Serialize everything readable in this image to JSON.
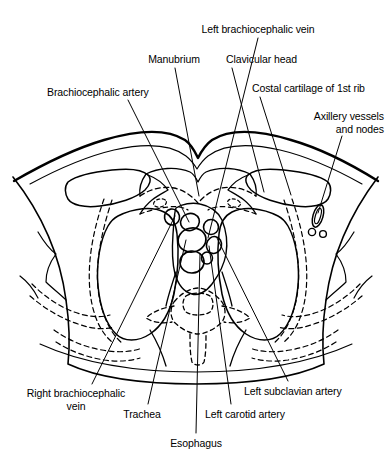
{
  "figure": {
    "type": "anatomical-line-diagram",
    "line_color": "#000000",
    "background_color": "#ffffff",
    "width": 391,
    "height": 475
  },
  "labels": [
    {
      "id": "left-brachiocephalic-vein",
      "text": "Left brachiocephalic vein",
      "align": "align-center",
      "x": 182,
      "y": 23,
      "w": 152
    },
    {
      "id": "manubrium",
      "text": "Manubrium",
      "align": "align-center",
      "x": 134,
      "y": 53,
      "w": 80
    },
    {
      "id": "clavicular-head",
      "text": "Clavicular head",
      "align": "align-left",
      "x": 226,
      "y": 53,
      "w": 100
    },
    {
      "id": "brachiocephalic-artery",
      "text": "Brachiocephalic artery",
      "align": "align-left",
      "x": 47,
      "y": 86,
      "w": 140
    },
    {
      "id": "costal-cartilage-of-1st-rib",
      "text": "Costal cartilage of 1st rib",
      "align": "align-left",
      "x": 252,
      "y": 82,
      "w": 144
    },
    {
      "id": "axillery-vessels-and-nodes",
      "text": "Axillery vessels\nand nodes",
      "align": "align-right",
      "x": 274,
      "y": 110,
      "w": 110
    },
    {
      "id": "right-brachiocephalic-vein",
      "text": "Right brachiocephalic\nvein",
      "align": "align-center",
      "x": 12,
      "y": 387,
      "w": 128
    },
    {
      "id": "trachea",
      "text": "Trachea",
      "align": "align-center",
      "x": 117,
      "y": 408,
      "w": 50
    },
    {
      "id": "left-carotid-artery",
      "text": "Left carotid artery",
      "align": "align-left",
      "x": 205,
      "y": 408,
      "w": 110
    },
    {
      "id": "left-subclavian-artery",
      "text": "Left subclavian artery",
      "align": "align-left",
      "x": 244,
      "y": 385,
      "w": 140
    },
    {
      "id": "esophagus",
      "text": "Esophagus",
      "align": "align-center",
      "x": 160,
      "y": 437,
      "w": 72
    }
  ],
  "leader_lines": [
    {
      "id": "leader-left-brachiocephalic-vein",
      "from": [
        258,
        38
      ],
      "to": [
        208,
        238
      ]
    },
    {
      "id": "leader-manubrium",
      "from": [
        175,
        68
      ],
      "to": [
        199,
        196
      ]
    },
    {
      "id": "leader-clavicular-head",
      "from": [
        232,
        68
      ],
      "to": [
        264,
        192
      ]
    },
    {
      "id": "leader-brachiocephalic-artery",
      "from": [
        128,
        100
      ],
      "to": [
        189,
        222
      ]
    },
    {
      "id": "leader-costal-cartilage",
      "from": [
        260,
        97
      ],
      "to": [
        291,
        195
      ]
    },
    {
      "id": "leader-axillery-vessels",
      "from": [
        342,
        136
      ],
      "to": [
        318,
        216
      ]
    },
    {
      "id": "leader-right-brachiocephalic-vein",
      "from": [
        92,
        384
      ],
      "to": [
        175,
        216
      ]
    },
    {
      "id": "leader-trachea",
      "from": [
        148,
        404
      ],
      "to": [
        186,
        238
      ]
    },
    {
      "id": "leader-esophagus",
      "from": [
        196,
        433
      ],
      "to": [
        199,
        254
      ]
    },
    {
      "id": "leader-left-carotid-artery",
      "from": [
        231,
        404
      ],
      "to": [
        208,
        246
      ]
    },
    {
      "id": "leader-left-subclavian-artery",
      "from": [
        288,
        381
      ],
      "to": [
        216,
        236
      ]
    }
  ],
  "structures": [
    {
      "id": "skin-outline",
      "kind": "solid-contour",
      "description": "outer body wall of the thorax"
    },
    {
      "id": "manubrium-body",
      "kind": "solid-contour",
      "description": "manubrium sterni anterior midline"
    },
    {
      "id": "clavicle-left",
      "kind": "solid-contour",
      "description": "left clavicular head at sternoclavicular joint"
    },
    {
      "id": "clavicle-right",
      "kind": "solid-contour",
      "description": "right clavicular head at sternoclavicular joint"
    },
    {
      "id": "lung-left",
      "kind": "solid-contour",
      "description": "left lung apex field"
    },
    {
      "id": "lung-right",
      "kind": "solid-contour",
      "description": "right lung apex field"
    },
    {
      "id": "vertebral-body",
      "kind": "dashed-contour",
      "description": "thoracic vertebra and spinal canal"
    },
    {
      "id": "rib-left",
      "kind": "dashed-contour",
      "description": "left first rib and costal cartilage"
    },
    {
      "id": "rib-right",
      "kind": "dashed-contour",
      "description": "right first rib and costal cartilage"
    },
    {
      "id": "vessel-brachiocephalic-artery",
      "kind": "ellipse",
      "description": "brachiocephalic artery lumen"
    },
    {
      "id": "vessel-left-brachiocephalic-vein",
      "kind": "ellipse",
      "description": "left brachiocephalic vein lumen"
    },
    {
      "id": "vessel-left-carotid-artery",
      "kind": "ellipse",
      "description": "left common carotid artery lumen"
    },
    {
      "id": "vessel-left-subclavian-artery",
      "kind": "ellipse",
      "description": "left subclavian artery lumen"
    },
    {
      "id": "vessel-right-brachiocephalic-vein",
      "kind": "ellipse",
      "description": "right brachiocephalic vein lumen"
    },
    {
      "id": "trachea-lumen",
      "kind": "ellipse",
      "description": "tracheal air column"
    },
    {
      "id": "esophagus-lumen",
      "kind": "ellipse",
      "description": "esophageal lumen posterior to trachea"
    },
    {
      "id": "axillary-vessels",
      "kind": "ellipse-cluster",
      "description": "axillary vessels and lymph nodes"
    }
  ]
}
